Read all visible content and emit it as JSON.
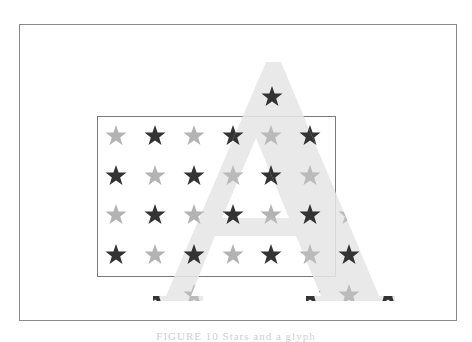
{
  "figure": {
    "caption": "FIGURE 10  Stars and a glyph",
    "colors": {
      "background": "#ffffff",
      "frame": "#8a8a8a",
      "box": "#7a7a7a",
      "star_dark": "#333333",
      "star_light": "#b3b3b3",
      "glyph_fill": "#e6e6e6"
    },
    "outer_frame": {
      "x": 19,
      "y": 24,
      "w": 437,
      "h": 296
    },
    "inner_box": {
      "x": 97,
      "y": 116,
      "w": 238,
      "h": 160
    },
    "glyph": {
      "letter": "A",
      "style": "serif",
      "apex": [
        273,
        60
      ]
    },
    "star_grid": {
      "cols_x": [
        116,
        155,
        194,
        233,
        271,
        310,
        349
      ],
      "rows_y": [
        97,
        136,
        176,
        215,
        255,
        295
      ],
      "pattern": "checkerboard dark/light"
    }
  }
}
